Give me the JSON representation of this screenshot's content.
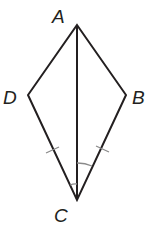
{
  "diagram": {
    "type": "kite",
    "vertices": {
      "A": {
        "label": "A",
        "x": 77,
        "y": 25
      },
      "B": {
        "label": "B",
        "x": 126,
        "y": 95
      },
      "C": {
        "label": "C",
        "x": 77,
        "y": 200
      },
      "D": {
        "label": "D",
        "x": 28,
        "y": 95
      }
    },
    "segments": [
      "AB",
      "BC",
      "CD",
      "DA",
      "AC"
    ],
    "congruence_marks": {
      "segments": [
        "DC",
        "BC"
      ],
      "tick_count": 1
    },
    "angle_marks": {
      "angles": [
        "DCA",
        "ACB"
      ],
      "arc_count": 1
    },
    "colors": {
      "line": "#231f20",
      "mark": "#8a8a8a",
      "background": "#ffffff"
    }
  }
}
